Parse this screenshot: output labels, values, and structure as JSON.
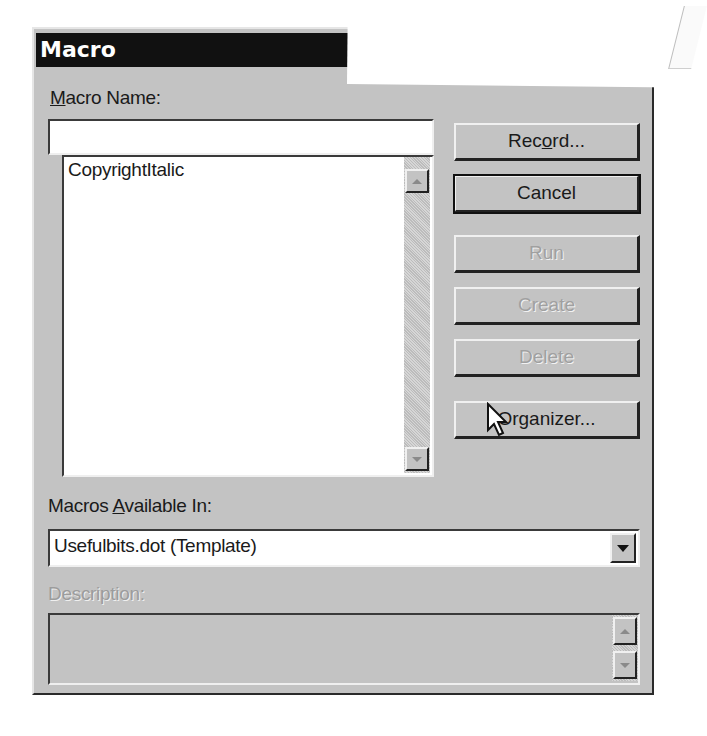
{
  "dialog": {
    "title": "Macro",
    "macro_name": {
      "label_accel": "M",
      "label_rest": "acro Name:",
      "value": ""
    },
    "macro_list": {
      "items": [
        "CopyrightItalic"
      ]
    },
    "buttons": {
      "record": {
        "pre": "Rec",
        "accel": "o",
        "post": "rd...",
        "enabled": true
      },
      "cancel": {
        "label": "Cancel",
        "enabled": true
      },
      "run": {
        "label": "Run",
        "enabled": false
      },
      "create": {
        "label": "Create",
        "enabled": false
      },
      "delete": {
        "label": "Delete",
        "enabled": false
      },
      "organizer": {
        "pre": "Or",
        "accel": "g",
        "post": "anizer...",
        "enabled": true
      }
    },
    "macros_available_in": {
      "label_pre": "Macros ",
      "label_accel": "A",
      "label_post": "vailable In:",
      "selected": "Usefulbits.dot (Template)"
    },
    "description": {
      "label": "Description:",
      "value": ""
    }
  },
  "icons": {
    "scroll_up": "triangle-up",
    "scroll_down": "triangle-down",
    "combo_dropdown": "triangle-down",
    "mouse_pointer": "arrow-cursor"
  },
  "colors": {
    "face": "#c3c3c3",
    "titlebar": "#111111",
    "text": "#1a1a1a",
    "disabled_text": "#a0a0a0"
  }
}
